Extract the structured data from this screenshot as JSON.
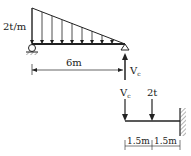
{
  "diagram": {
    "beam1": {
      "load_label": "2t/m",
      "span_label": "6m",
      "reaction_label": "V",
      "reaction_sub": "c"
    },
    "beam2": {
      "reaction_label": "V",
      "reaction_sub": "c",
      "point_load_label": "2t",
      "dim1_label": "1.5m",
      "dim2_label": "1.5m"
    },
    "colors": {
      "line": "#222222",
      "background": "#ffffff"
    }
  }
}
